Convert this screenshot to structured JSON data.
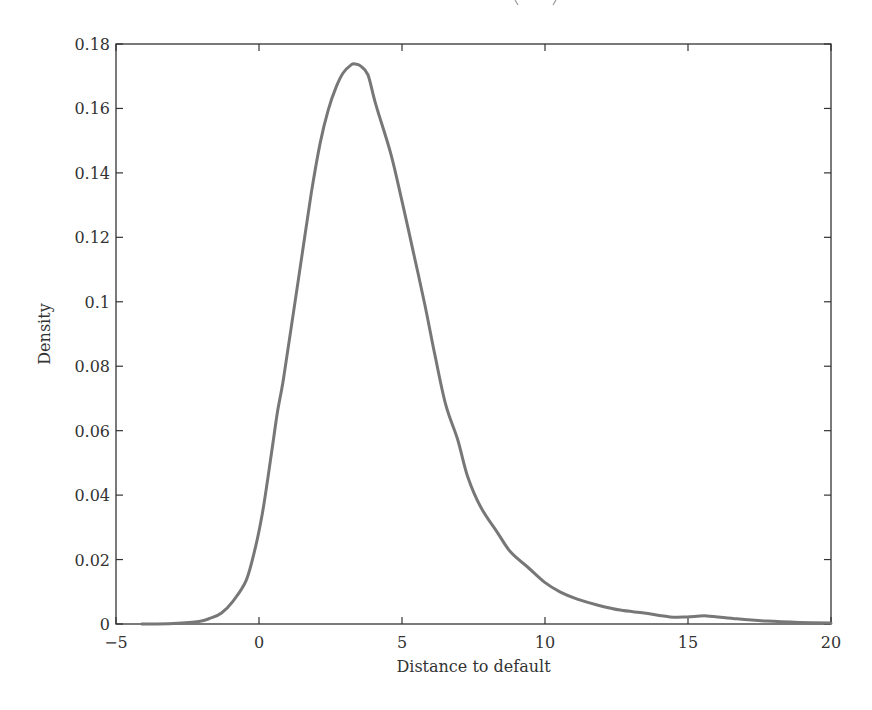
{
  "chart_data": {
    "type": "line",
    "title": "",
    "xlabel": "Distance to default",
    "ylabel": "Density",
    "xlim": [
      -5,
      20
    ],
    "ylim": [
      0,
      0.18
    ],
    "xticks": [
      -5,
      0,
      5,
      10,
      15,
      20
    ],
    "xtick_labels": [
      "−5",
      "0",
      "5",
      "10",
      "15",
      "20"
    ],
    "yticks": [
      0,
      0.02,
      0.04,
      0.06,
      0.08,
      0.1,
      0.12,
      0.14,
      0.16,
      0.18
    ],
    "ytick_labels": [
      "0",
      "0.02",
      "0.04",
      "0.06",
      "0.08",
      "0.1",
      "0.12",
      "0.14",
      "0.16",
      "0.18"
    ],
    "grid": false,
    "legend": null,
    "series": [
      {
        "name": "Density",
        "color": "#777777",
        "x": [
          -4.1,
          -3.0,
          -2.1,
          -1.7,
          -1.31,
          -0.9,
          -0.44,
          -0.12,
          0.12,
          0.3,
          0.47,
          0.64,
          0.85,
          1.13,
          1.48,
          1.83,
          2.14,
          2.42,
          2.7,
          2.94,
          3.22,
          3.36,
          3.55,
          3.81,
          4.09,
          4.62,
          5.03,
          5.42,
          5.8,
          6.15,
          6.53,
          6.95,
          7.3,
          7.75,
          8.35,
          8.8,
          9.39,
          9.98,
          10.54,
          11.13,
          11.83,
          12.63,
          13.47,
          14.37,
          14.97,
          15.66,
          16.71,
          17.75,
          18.9,
          20.0
        ],
        "values": [
          0.0,
          0.0002,
          0.0008,
          0.0018,
          0.0034,
          0.0072,
          0.0137,
          0.024,
          0.0344,
          0.0447,
          0.055,
          0.0655,
          0.0757,
          0.0922,
          0.113,
          0.1338,
          0.1493,
          0.1595,
          0.1667,
          0.171,
          0.1735,
          0.1738,
          0.1732,
          0.1704,
          0.161,
          0.1456,
          0.13,
          0.1145,
          0.099,
          0.0835,
          0.068,
          0.0571,
          0.0456,
          0.0363,
          0.0282,
          0.0223,
          0.0177,
          0.013,
          0.0099,
          0.0077,
          0.0059,
          0.0043,
          0.0034,
          0.0022,
          0.0022,
          0.0025,
          0.0016,
          0.0009,
          0.0005,
          0.0003
        ]
      }
    ]
  },
  "layout": {
    "plot_left": 116,
    "plot_right": 831,
    "plot_top": 44,
    "plot_bottom": 624
  }
}
